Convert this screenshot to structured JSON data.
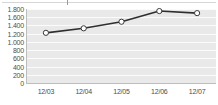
{
  "chart_data": {
    "type": "line",
    "title": "",
    "subtitle": "",
    "xlabel": "",
    "ylabel": "",
    "categories": [
      "12/03",
      "12/04",
      "12/05",
      "12/06",
      "12/07"
    ],
    "series": [
      {
        "name": "series-1",
        "values": [
          1220,
          1330,
          1490,
          1750,
          1700
        ]
      }
    ],
    "ylim": [
      0,
      1800
    ],
    "ytick_values": [
      0,
      200,
      400,
      600,
      800,
      1000,
      1200,
      1400,
      1600,
      1800
    ],
    "ytick_labels": [
      "0",
      "200",
      "400",
      "600",
      "800",
      "1.000",
      "1.200",
      "1.400",
      "1.600",
      "1.800"
    ],
    "grid": true,
    "grid_orientation": "horizontal",
    "legend": false,
    "legend_position": "none",
    "marker": "circle-open",
    "colors": {
      "line": "#2f2f2f",
      "marker_fill": "#ffffff",
      "marker_stroke": "#3a3a3a",
      "plot_background": "#e9e9e9",
      "gridline": "#fbfbfb",
      "axis": "#bdbdbd",
      "tick_label": "#4d4d4d",
      "page_background": "#ffffff"
    }
  }
}
